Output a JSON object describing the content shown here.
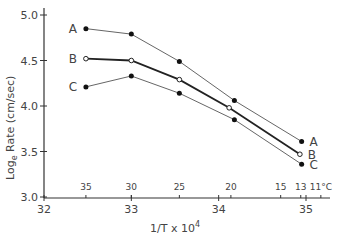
{
  "chart_data": {
    "type": "line",
    "title": "",
    "xlabel": "1/T x 10^4",
    "xlabel_main": "1/T x 10",
    "xlabel_sup": "4",
    "ylabel_main": "Log",
    "ylabel_sub": "e",
    "ylabel_rest": " Rate  (cm/sec)",
    "xlim": [
      32,
      35
    ],
    "ylim": [
      3.0,
      5.0
    ],
    "x_ticks": [
      {
        "value": 32,
        "label": "32"
      },
      {
        "value": 33,
        "label": "33"
      },
      {
        "value": 34,
        "label": "34"
      },
      {
        "value": 35,
        "label": "35"
      }
    ],
    "y_ticks": [
      {
        "value": 3.0,
        "label": "3.0"
      },
      {
        "value": 3.5,
        "label": "3.5"
      },
      {
        "value": 4.0,
        "label": "4.0"
      },
      {
        "value": 4.5,
        "label": "4.5"
      },
      {
        "value": 5.0,
        "label": "5.0"
      }
    ],
    "temperature_ticks": [
      {
        "x": 32.48,
        "label": "35"
      },
      {
        "x": 33.0,
        "label": "30"
      },
      {
        "x": 33.55,
        "label": "25"
      },
      {
        "x": 34.14,
        "label": "20"
      },
      {
        "x": 34.71,
        "label": "15"
      },
      {
        "x": 34.94,
        "label": "13"
      },
      {
        "x": 35.17,
        "label": "11°C"
      }
    ],
    "grid": false,
    "series": [
      {
        "name": "A",
        "marker": "filled",
        "style": "thin",
        "x": [
          32.48,
          33.0,
          33.55,
          34.18,
          34.95
        ],
        "y": [
          4.85,
          4.79,
          4.49,
          4.06,
          3.61
        ]
      },
      {
        "name": "B",
        "marker": "open",
        "style": "thick",
        "x": [
          32.48,
          33.0,
          33.55,
          34.12,
          34.93
        ],
        "y": [
          4.52,
          4.5,
          4.29,
          3.98,
          3.47
        ]
      },
      {
        "name": "C",
        "marker": "filled",
        "style": "thin",
        "x": [
          32.48,
          33.0,
          33.55,
          34.18,
          34.95
        ],
        "y": [
          4.21,
          4.33,
          4.14,
          3.85,
          3.36
        ]
      }
    ]
  }
}
